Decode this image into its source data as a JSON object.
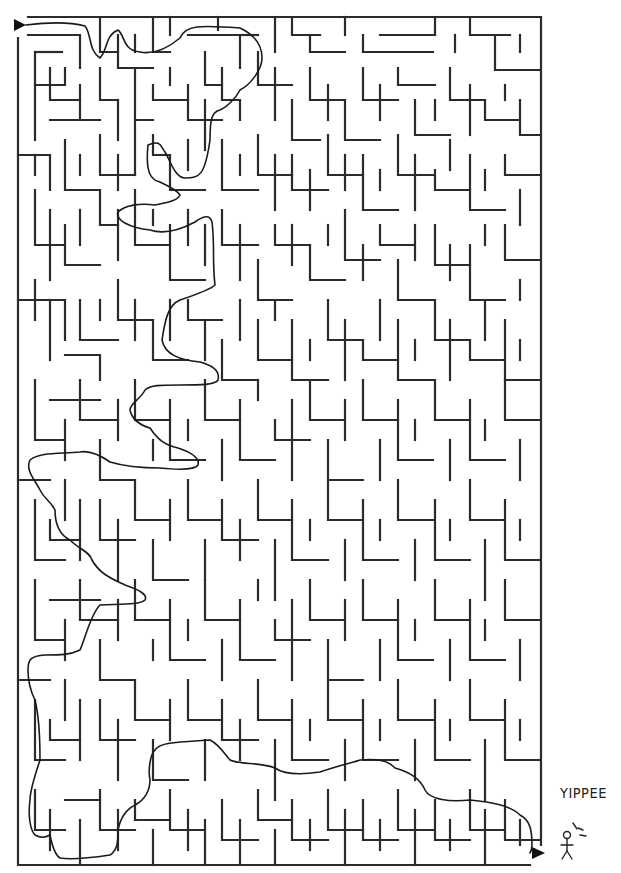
{
  "maze": {
    "title_fragment": "",
    "bounds": {
      "left": 18,
      "top": 17,
      "right": 541,
      "bottom": 865
    },
    "cell_size": 17.5,
    "entrance": {
      "label": "start-arrow",
      "x": 18,
      "y": 25
    },
    "exit": {
      "label": "finish-arrow",
      "x": 538,
      "y": 853
    },
    "colors": {
      "wall": "#2b2b2b",
      "solution": "#1a1a1a",
      "background": "#ffffff"
    }
  },
  "annotation": {
    "text": "YIPPEE",
    "figure": "stick-figure"
  }
}
